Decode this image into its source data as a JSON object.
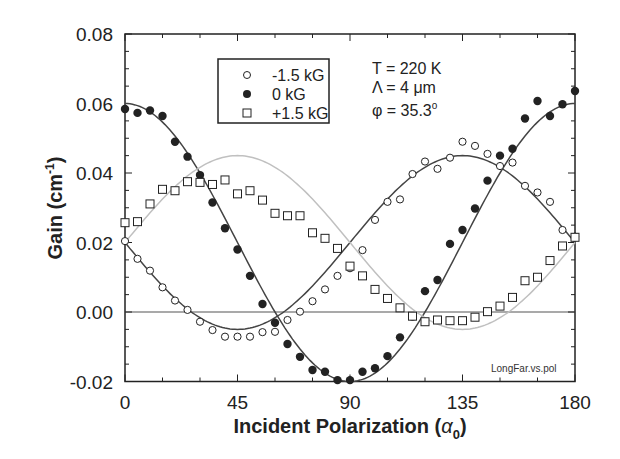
{
  "chart_data": {
    "type": "scatter",
    "title": "",
    "xlabel": "Incident Polarization (α0)",
    "ylabel": "Gain (cm-1)",
    "xlim": [
      0,
      180
    ],
    "ylim": [
      -0.02,
      0.08
    ],
    "xticks": [
      0,
      45,
      90,
      135,
      180
    ],
    "xtick_labels": [
      "0",
      "45",
      "90",
      "135",
      "180"
    ],
    "yticks": [
      -0.02,
      0.0,
      0.02,
      0.04,
      0.06,
      0.08
    ],
    "ytick_labels": [
      "-0.02",
      "0.00",
      "0.02",
      "0.04",
      "0.06",
      "0.08"
    ],
    "grid": false,
    "zero_line": true,
    "legend_position": "upper-left-inside",
    "x": [
      0,
      5,
      10,
      15,
      20,
      25,
      30,
      35,
      40,
      45,
      50,
      55,
      60,
      65,
      70,
      75,
      80,
      85,
      90,
      95,
      100,
      105,
      110,
      115,
      120,
      125,
      130,
      135,
      140,
      145,
      150,
      155,
      160,
      165,
      170,
      175,
      180
    ],
    "series": [
      {
        "name": "-1.5 kG",
        "marker": "open-circle",
        "values": [
          0.0204,
          0.0153,
          0.0119,
          0.0071,
          0.0033,
          0.0006,
          -0.0028,
          -0.0052,
          -0.0071,
          -0.0071,
          -0.0071,
          -0.0058,
          -0.0057,
          -0.0023,
          0.0001,
          0.0031,
          0.0065,
          0.0104,
          0.0126,
          0.0178,
          0.0265,
          0.0317,
          0.0324,
          0.0397,
          0.0433,
          0.0412,
          0.0444,
          0.049,
          0.0478,
          0.0455,
          0.042,
          0.043,
          0.0363,
          0.0344,
          0.0317,
          0.0236,
          0.0217
        ],
        "fit": {
          "form": "0.02 + 0.025*cos(2*(a-135))",
          "color": "#444444"
        }
      },
      {
        "name": "0 kG",
        "marker": "filled-circle",
        "values": [
          0.0584,
          0.0573,
          0.058,
          0.0564,
          0.049,
          0.0447,
          0.0394,
          0.0315,
          0.0241,
          0.018,
          0.0104,
          0.0023,
          -0.0031,
          -0.0092,
          -0.0129,
          -0.0167,
          -0.0172,
          -0.0196,
          -0.0196,
          -0.0172,
          -0.0162,
          -0.0127,
          -0.0073,
          -0.0013,
          0.006,
          0.0092,
          0.0196,
          0.0236,
          0.0298,
          0.0378,
          0.045,
          0.047,
          0.0557,
          0.0607,
          0.0564,
          0.0598,
          0.0636
        ],
        "fit": {
          "form": "0.02 + 0.04*cos(2*a)",
          "color": "#444444"
        }
      },
      {
        "name": "+1.5 kG",
        "marker": "open-square",
        "values": [
          0.0257,
          0.026,
          0.0311,
          0.0353,
          0.0349,
          0.0375,
          0.0373,
          0.0367,
          0.038,
          0.034,
          0.0349,
          0.0322,
          0.0284,
          0.0277,
          0.0277,
          0.0228,
          0.0212,
          0.0183,
          0.0132,
          0.0104,
          0.0065,
          0.0039,
          0.0012,
          -0.0012,
          -0.0028,
          -0.0023,
          -0.0025,
          -0.0025,
          -0.0015,
          0.0001,
          0.0017,
          0.0042,
          0.009,
          0.01,
          0.0148,
          0.019,
          0.0215
        ],
        "fit": {
          "form": "0.02 + 0.025*cos(2*(a-45))",
          "color": "#bbbbbb"
        }
      }
    ],
    "annotations": [
      "T = 220 K",
      "Λ = 4 μm",
      "φ = 35.3°",
      "LongFar.vs.pol"
    ]
  },
  "labels": {
    "ylabel_main": "Gain (cm",
    "ylabel_sup": "-1",
    "ylabel_close": ")",
    "xlabel_main": "Incident Polarization (",
    "xlabel_alpha": "α",
    "xlabel_sub": "0",
    "xlabel_close": ")",
    "legend": [
      "-1.5 kG",
      "0 kG",
      "+1.5 kG"
    ],
    "ann_T": "T = 220 K",
    "ann_L": "Λ = 4 μm",
    "ann_phi": "φ = 35.3",
    "ann_deg": "o",
    "note": "LongFar.vs.pol"
  },
  "colors": {
    "ink": "#222222",
    "fit_dark": "#444444",
    "fit_light": "#c0c0c0"
  }
}
